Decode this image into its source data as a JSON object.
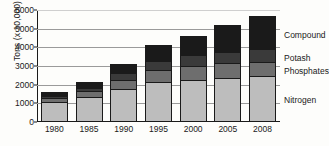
{
  "chart_data": {
    "type": "bar",
    "title": "",
    "xlabel": "",
    "ylabel": "Tons (x 10,000)",
    "ylim": [
      0,
      6000
    ],
    "yticks": [
      0,
      1000,
      2000,
      3000,
      4000,
      5000,
      6000
    ],
    "grid": true,
    "stacked": true,
    "legend_position": "right-inline",
    "categories": [
      "1980",
      "1985",
      "1990",
      "1995",
      "2000",
      "2005",
      "2008"
    ],
    "series": [
      {
        "name": "Nitrogen",
        "color": "#bdbdbd",
        "values": [
          950,
          1230,
          1660,
          2040,
          2170,
          2260,
          2340
        ]
      },
      {
        "name": "Phosphates",
        "color": "#6e6e6e",
        "values": [
          230,
          330,
          500,
          640,
          720,
          780,
          780
        ]
      },
      {
        "name": "Potash",
        "color": "#3a3a3a",
        "values": [
          130,
          180,
          340,
          490,
          580,
          620,
          660
        ]
      },
      {
        "name": "Compound",
        "color": "#1a1a1a",
        "values": [
          210,
          290,
          480,
          860,
          1050,
          1420,
          1780
        ]
      }
    ],
    "totals": [
      1520,
      2030,
      2980,
      4030,
      4520,
      5080,
      5560
    ]
  }
}
